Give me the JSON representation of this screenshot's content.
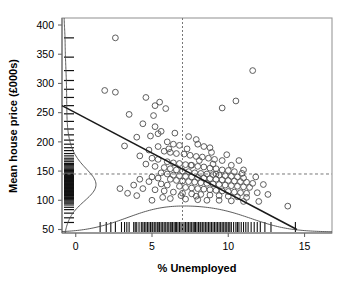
{
  "chart_data": {
    "type": "scatter",
    "title": "",
    "xlabel": "% Unemployed",
    "ylabel": "Mean house price (£000s)",
    "xlim": [
      -0.9,
      16.8
    ],
    "ylim": [
      44,
      412
    ],
    "xticks": [
      0,
      5,
      10,
      15
    ],
    "xtick_labels": [
      "0",
      "5",
      "10",
      "15"
    ],
    "yticks": [
      50,
      100,
      150,
      200,
      250,
      300,
      350,
      400
    ],
    "ytick_labels": [
      "50",
      "100",
      "150",
      "200",
      "250",
      "300",
      "350",
      "400"
    ],
    "grid": false,
    "legend": null,
    "point_marker": "open-circle",
    "point_color": "#555555",
    "reference_lines": {
      "vertical_x": 7.0,
      "horizontal_y": 145.0,
      "style": "dashed"
    },
    "regression_line": {
      "x0": -0.9,
      "y0": 262.0,
      "x1": 14.5,
      "y1": 50.0,
      "style": "solid"
    },
    "x_rug_values": [
      1.6,
      2.0,
      2.3,
      2.6,
      3.0,
      3.2,
      3.35,
      3.5,
      3.8,
      3.9,
      4.0,
      4.15,
      4.3,
      4.4,
      4.5,
      4.6,
      4.7,
      4.8,
      4.9,
      5.0,
      5.05,
      5.15,
      5.25,
      5.35,
      5.45,
      5.5,
      5.6,
      5.7,
      5.8,
      5.9,
      6.0,
      6.1,
      6.2,
      6.3,
      6.35,
      6.45,
      6.55,
      6.6,
      6.7,
      6.8,
      6.9,
      7.0,
      7.1,
      7.2,
      7.3,
      7.4,
      7.5,
      7.6,
      7.7,
      7.8,
      7.85,
      7.95,
      8.05,
      8.15,
      8.2,
      8.3,
      8.4,
      8.5,
      8.6,
      8.7,
      8.8,
      8.9,
      9.0,
      9.1,
      9.2,
      9.3,
      9.4,
      9.5,
      9.6,
      9.7,
      9.8,
      9.9,
      10.0,
      10.1,
      10.2,
      10.35,
      10.5,
      10.6,
      10.7,
      10.85,
      11.0,
      11.15,
      11.3,
      11.5,
      11.7,
      11.9,
      12.1,
      12.4,
      12.8,
      14.4
    ],
    "y_rug_values": [
      62,
      70,
      78,
      84,
      88,
      92,
      95,
      97,
      99,
      101,
      103,
      105,
      106,
      108,
      109,
      110,
      111,
      112,
      113,
      114,
      115,
      116,
      117,
      118,
      119,
      120,
      121,
      122,
      123,
      124,
      125,
      126,
      127,
      128,
      129,
      130,
      131,
      132,
      133,
      134,
      135,
      136,
      137,
      138,
      139,
      140,
      141,
      142,
      143,
      144,
      145,
      147,
      149,
      151,
      153,
      155,
      157,
      159,
      161,
      163,
      166,
      169,
      172,
      176,
      180,
      185,
      190,
      196,
      203,
      212,
      222,
      235,
      248,
      262,
      276,
      290,
      305,
      322,
      345,
      378
    ],
    "points": [
      [
        2.6,
        378
      ],
      [
        11.6,
        322
      ],
      [
        1.9,
        288
      ],
      [
        2.6,
        285
      ],
      [
        4.6,
        276
      ],
      [
        5.5,
        268
      ],
      [
        5.2,
        262
      ],
      [
        5.9,
        257
      ],
      [
        10.5,
        270
      ],
      [
        9.6,
        258
      ],
      [
        3.5,
        247
      ],
      [
        5.1,
        245
      ],
      [
        4.4,
        231
      ],
      [
        5.2,
        226
      ],
      [
        5.6,
        218
      ],
      [
        5.4,
        214
      ],
      [
        4.0,
        208
      ],
      [
        7.4,
        209
      ],
      [
        7.9,
        204
      ],
      [
        6.0,
        200
      ],
      [
        6.4,
        196
      ],
      [
        6.8,
        194
      ],
      [
        8.0,
        196
      ],
      [
        8.4,
        192
      ],
      [
        8.8,
        190
      ],
      [
        3.2,
        193
      ],
      [
        4.8,
        186
      ],
      [
        5.8,
        184
      ],
      [
        6.2,
        182
      ],
      [
        6.6,
        180
      ],
      [
        7.1,
        179
      ],
      [
        7.5,
        177
      ],
      [
        7.9,
        175
      ],
      [
        8.3,
        174
      ],
      [
        8.7,
        172
      ],
      [
        9.1,
        170
      ],
      [
        9.6,
        168
      ],
      [
        5.0,
        172
      ],
      [
        5.4,
        170
      ],
      [
        4.2,
        176
      ],
      [
        6.0,
        166
      ],
      [
        6.4,
        164
      ],
      [
        6.8,
        163
      ],
      [
        7.2,
        161
      ],
      [
        7.6,
        160
      ],
      [
        8.0,
        158
      ],
      [
        8.4,
        157
      ],
      [
        8.8,
        155
      ],
      [
        9.2,
        154
      ],
      [
        9.6,
        152
      ],
      [
        10.0,
        151
      ],
      [
        10.4,
        149
      ],
      [
        4.6,
        162
      ],
      [
        5.2,
        158
      ],
      [
        5.8,
        156
      ],
      [
        6.2,
        154
      ],
      [
        6.6,
        152
      ],
      [
        7.0,
        150
      ],
      [
        7.4,
        149
      ],
      [
        7.8,
        147
      ],
      [
        8.2,
        146
      ],
      [
        8.6,
        145
      ],
      [
        9.0,
        144
      ],
      [
        9.4,
        143
      ],
      [
        9.8,
        142
      ],
      [
        10.2,
        141
      ],
      [
        10.6,
        140
      ],
      [
        11.0,
        138
      ],
      [
        5.6,
        147
      ],
      [
        6.0,
        145
      ],
      [
        6.4,
        143
      ],
      [
        6.8,
        142
      ],
      [
        7.2,
        141
      ],
      [
        7.6,
        140
      ],
      [
        8.0,
        139
      ],
      [
        8.4,
        138
      ],
      [
        8.8,
        137
      ],
      [
        9.2,
        136
      ],
      [
        9.6,
        135
      ],
      [
        10.0,
        134
      ],
      [
        10.4,
        133
      ],
      [
        10.8,
        132
      ],
      [
        11.2,
        131
      ],
      [
        11.6,
        129
      ],
      [
        5.0,
        140
      ],
      [
        5.4,
        138
      ],
      [
        6.2,
        136
      ],
      [
        6.6,
        134
      ],
      [
        7.0,
        133
      ],
      [
        7.4,
        132
      ],
      [
        7.8,
        131
      ],
      [
        8.2,
        130
      ],
      [
        8.6,
        129
      ],
      [
        9.0,
        128
      ],
      [
        9.4,
        127
      ],
      [
        9.8,
        126
      ],
      [
        10.2,
        125
      ],
      [
        10.6,
        124
      ],
      [
        11.0,
        123
      ],
      [
        11.4,
        122
      ],
      [
        4.2,
        136
      ],
      [
        4.8,
        132
      ],
      [
        5.6,
        128
      ],
      [
        6.0,
        126
      ],
      [
        6.8,
        124
      ],
      [
        7.2,
        122
      ],
      [
        7.6,
        121
      ],
      [
        8.0,
        120
      ],
      [
        8.4,
        119
      ],
      [
        8.8,
        118
      ],
      [
        9.2,
        117
      ],
      [
        9.6,
        116
      ],
      [
        10.0,
        115
      ],
      [
        10.4,
        114
      ],
      [
        10.8,
        113
      ],
      [
        11.2,
        112
      ],
      [
        3.8,
        126
      ],
      [
        4.4,
        120
      ],
      [
        5.2,
        118
      ],
      [
        5.8,
        116
      ],
      [
        6.4,
        114
      ],
      [
        7.0,
        112
      ],
      [
        7.6,
        111
      ],
      [
        8.2,
        110
      ],
      [
        8.8,
        109
      ],
      [
        9.4,
        108
      ],
      [
        10.0,
        107
      ],
      [
        10.6,
        106
      ],
      [
        11.2,
        105
      ],
      [
        11.9,
        113
      ],
      [
        12.6,
        110
      ],
      [
        9.2,
        145
      ],
      [
        10.9,
        146
      ],
      [
        13.9,
        90
      ],
      [
        2.9,
        120
      ],
      [
        3.4,
        112
      ],
      [
        4.0,
        108
      ],
      [
        6.2,
        103
      ],
      [
        7.2,
        102
      ],
      [
        8.0,
        101
      ],
      [
        8.6,
        100
      ],
      [
        9.4,
        100
      ],
      [
        10.2,
        99
      ],
      [
        11.0,
        98
      ],
      [
        12.0,
        98
      ],
      [
        6.9,
        108
      ],
      [
        7.9,
        107
      ],
      [
        5.0,
        100
      ],
      [
        5.7,
        105
      ],
      [
        7.55,
        160
      ],
      [
        8.1,
        168
      ],
      [
        6.1,
        188
      ],
      [
        9.0,
        162
      ],
      [
        10.2,
        160
      ],
      [
        11.0,
        152
      ],
      [
        11.8,
        140
      ],
      [
        12.3,
        127
      ],
      [
        4.9,
        210
      ],
      [
        6.5,
        215
      ],
      [
        7.3,
        188
      ],
      [
        8.9,
        182
      ],
      [
        9.9,
        178
      ],
      [
        10.7,
        168
      ],
      [
        5.4,
        192
      ]
    ],
    "x_density_curve": {
      "description": "kernel density of % unemployed along bottom margin, peak near 8",
      "peak_x": 8.2
    },
    "y_density_curve": {
      "description": "kernel density of mean house price along left margin, peak near 115",
      "peak_y": 115
    }
  }
}
